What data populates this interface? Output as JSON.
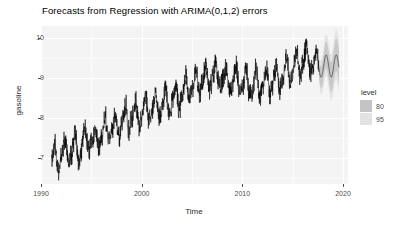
{
  "chart_data": {
    "type": "line",
    "title": "Forecasts from Regression with ARIMA(0,1,2) errors",
    "xlabel": "Time",
    "ylabel": "gasoline",
    "xlim": [
      1990,
      2020.5
    ],
    "ylim": [
      6.35,
      10.3
    ],
    "x_ticks": [
      1990,
      2000,
      2010,
      2020
    ],
    "y_ticks": [
      7,
      8,
      9,
      10
    ],
    "grid": true,
    "legend": {
      "title": "level",
      "position": "right",
      "entries": [
        {
          "label": "80",
          "color": "#c4c4c4"
        },
        {
          "label": "95",
          "color": "#e2e2e2"
        }
      ]
    },
    "series": [
      {
        "name": "gasoline",
        "color": "#000000",
        "x_start": 1991.04,
        "x_end": 2017.6,
        "n_points": 1385,
        "trend_knots_x": [
          1991.0,
          1993.0,
          1995.0,
          1997.0,
          1999.0,
          2001.0,
          2003.0,
          2005.0,
          2007.0,
          2009.0,
          2011.0,
          2013.0,
          2015.0,
          2016.5,
          2017.6
        ],
        "trend_knots_y": [
          6.95,
          7.2,
          7.45,
          7.75,
          8.05,
          8.25,
          8.45,
          8.8,
          9.05,
          8.95,
          8.85,
          8.95,
          9.25,
          9.5,
          9.3
        ],
        "seasonal_amplitude": 0.3,
        "noise_amplitude": 0.22,
        "seasonal_period_years": 1.0
      },
      {
        "name": "point forecast",
        "color": "#3b3b3b",
        "x_start": 2017.6,
        "x_end": 2019.6,
        "n_points": 105,
        "mean_level": 9.3,
        "seasonal_amplitude": 0.28
      }
    ],
    "forecast_intervals": [
      {
        "level": 80,
        "color": "#c9c9c9",
        "half_width_start": 0.2,
        "half_width_end": 0.42
      },
      {
        "level": 95,
        "color": "#e4e4e4",
        "half_width_start": 0.31,
        "half_width_end": 0.66
      }
    ],
    "annotations": []
  },
  "panel": {
    "background": "#f4f4f4",
    "gridline_color": "#ffffff"
  }
}
